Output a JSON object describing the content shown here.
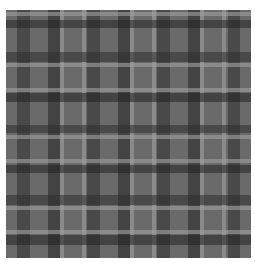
{
  "image": {
    "description": "Grayscale tartan plaid fabric texture",
    "base_color": "#6a6a6a",
    "vertical_bands": [
      {
        "x": 11,
        "w": 13,
        "color": "#2e2e2e",
        "opacity": 0.55
      },
      {
        "x": 42,
        "w": 12,
        "color": "#222222",
        "opacity": 0.55
      },
      {
        "x": 54,
        "w": 4,
        "color": "#a0a0a0",
        "opacity": 0.6
      },
      {
        "x": 76,
        "w": 4,
        "color": "#a0a0a0",
        "opacity": 0.6
      },
      {
        "x": 81,
        "w": 13,
        "color": "#2e2e2e",
        "opacity": 0.55
      },
      {
        "x": 112,
        "w": 12,
        "color": "#222222",
        "opacity": 0.55
      },
      {
        "x": 124,
        "w": 4,
        "color": "#a0a0a0",
        "opacity": 0.6
      },
      {
        "x": 146,
        "w": 4,
        "color": "#a0a0a0",
        "opacity": 0.6
      },
      {
        "x": 151,
        "w": 13,
        "color": "#2e2e2e",
        "opacity": 0.55
      },
      {
        "x": 182,
        "w": 12,
        "color": "#222222",
        "opacity": 0.55
      },
      {
        "x": 194,
        "w": 4,
        "color": "#a0a0a0",
        "opacity": 0.6
      },
      {
        "x": 216,
        "w": 4,
        "color": "#a0a0a0",
        "opacity": 0.6
      },
      {
        "x": 222,
        "w": 12,
        "color": "#2e2e2e",
        "opacity": 0.55
      }
    ],
    "horizontal_bands": [
      {
        "y": 2,
        "h": 4,
        "color": "#a0a0a0",
        "opacity": 0.6
      },
      {
        "y": 10,
        "h": 8,
        "color": "#222222",
        "opacity": 0.55
      },
      {
        "y": 42,
        "h": 10,
        "color": "#2e2e2e",
        "opacity": 0.55
      },
      {
        "y": 53,
        "h": 4,
        "color": "#a0a0a0",
        "opacity": 0.6
      },
      {
        "y": 78,
        "h": 4,
        "color": "#a0a0a0",
        "opacity": 0.6
      },
      {
        "y": 83,
        "h": 9,
        "color": "#222222",
        "opacity": 0.55
      },
      {
        "y": 115,
        "h": 8,
        "color": "#2e2e2e",
        "opacity": 0.55
      },
      {
        "y": 125,
        "h": 4,
        "color": "#a0a0a0",
        "opacity": 0.6
      },
      {
        "y": 149,
        "h": 4,
        "color": "#a0a0a0",
        "opacity": 0.6
      },
      {
        "y": 155,
        "h": 8,
        "color": "#222222",
        "opacity": 0.55
      },
      {
        "y": 185,
        "h": 10,
        "color": "#2e2e2e",
        "opacity": 0.55
      },
      {
        "y": 196,
        "h": 4,
        "color": "#a0a0a0",
        "opacity": 0.6
      },
      {
        "y": 220,
        "h": 4,
        "color": "#a0a0a0",
        "opacity": 0.6
      },
      {
        "y": 225,
        "h": 10,
        "color": "#222222",
        "opacity": 0.55
      }
    ]
  }
}
